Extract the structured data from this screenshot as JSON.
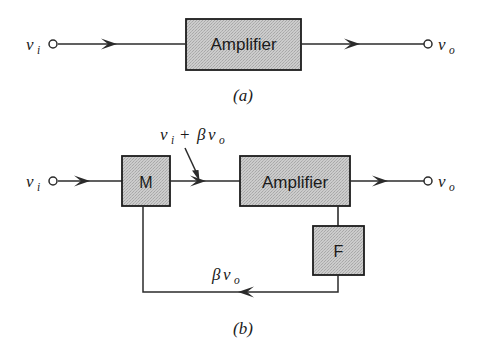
{
  "figure": {
    "background_color": "#ffffff",
    "line_color": "#2b2b2b",
    "box_fill_color": "#c9c9c9",
    "box_border_color": "#1c1c1c"
  },
  "panel_a": {
    "caption": "(a)",
    "input_label": {
      "symbol": "v",
      "subscript": "i"
    },
    "output_label": {
      "symbol": "v",
      "subscript": "o"
    },
    "block": {
      "label": "Amplifier"
    }
  },
  "panel_b": {
    "caption": "(b)",
    "input_label": {
      "symbol": "v",
      "subscript": "i"
    },
    "output_label": {
      "symbol": "v",
      "subscript": "o"
    },
    "blocks": [
      {
        "name": "mixer",
        "label": "M"
      },
      {
        "name": "amplifier",
        "label": "Amplifier"
      },
      {
        "name": "feedback",
        "label": "F"
      }
    ],
    "sum_annotation": {
      "part1_symbol": "v",
      "part1_subscript": "i",
      "operator": "+",
      "part2_beta": "β",
      "part2_symbol": "v",
      "part2_subscript": "o"
    },
    "feedback_annotation": {
      "beta": "β",
      "symbol": "v",
      "subscript": "o"
    }
  }
}
